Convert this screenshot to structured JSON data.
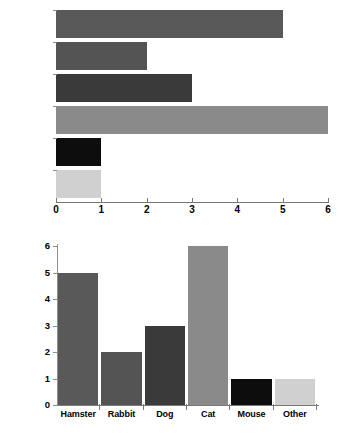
{
  "chart_data": [
    {
      "type": "bar",
      "orientation": "horizontal",
      "name": "pet-ownership-horizontal",
      "title": "",
      "xlabel": "",
      "ylabel": "",
      "categories": [
        "Hamster",
        "Rabbit",
        "Dog",
        "Cat",
        "Mouse",
        "Other"
      ],
      "values": [
        5,
        2,
        3,
        6,
        1,
        1
      ],
      "xlim": [
        0,
        6
      ],
      "xticks": [
        0,
        1,
        2,
        3,
        4,
        5,
        6
      ],
      "xtick_labels": [
        "0",
        "1",
        "2",
        "3",
        "4",
        "5",
        "6"
      ],
      "grid": false,
      "legend": false,
      "bar_colors": [
        "#595959",
        "#545454",
        "#3a3a3a",
        "#8a8a8a",
        "#0d0d0d",
        "#d0d0d0"
      ]
    },
    {
      "type": "bar",
      "orientation": "vertical",
      "name": "pet-ownership-vertical",
      "title": "",
      "xlabel": "",
      "ylabel": "",
      "categories": [
        "Hamster",
        "Rabbit",
        "Dog",
        "Cat",
        "Mouse",
        "Other"
      ],
      "values": [
        5,
        2,
        3,
        6,
        1,
        1
      ],
      "ylim": [
        0,
        6
      ],
      "yticks": [
        0,
        1,
        2,
        3,
        4,
        5,
        6
      ],
      "ytick_labels": [
        "0",
        "1",
        "2",
        "3",
        "4",
        "5",
        "6"
      ],
      "grid": false,
      "legend": false,
      "bar_colors": [
        "#595959",
        "#545454",
        "#3a3a3a",
        "#8a8a8a",
        "#0d0d0d",
        "#d0d0d0"
      ]
    }
  ],
  "axis_color": "#7a7a7a"
}
